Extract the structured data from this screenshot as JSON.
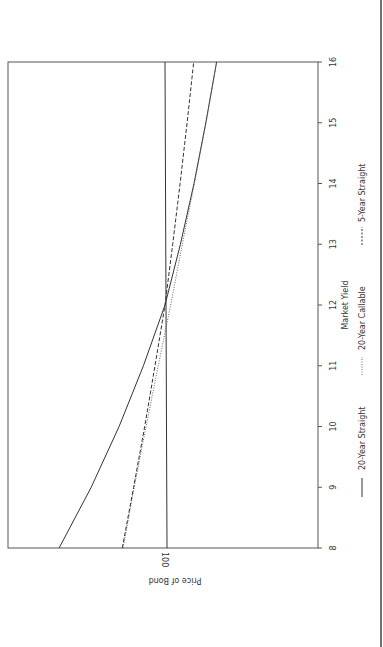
{
  "chart_data": {
    "type": "line",
    "orientation": "rotated 90 degrees clockwise (x-axis runs vertically on page)",
    "title": "",
    "xlabel": "Market Yield",
    "ylabel": "Price of Bond",
    "x_ticks": [
      "8",
      "9",
      "10",
      "11",
      "12",
      "13",
      "14",
      "15",
      "16"
    ],
    "y_ticks": [
      "100"
    ],
    "xlim": [
      8,
      16
    ],
    "reference_line": {
      "price": 100,
      "label": "100"
    },
    "x": [
      8,
      9,
      10,
      11,
      12,
      13,
      14,
      15,
      16
    ],
    "series": [
      {
        "name": "20-Year Straight",
        "style": "solid",
        "values": [
          139.6,
          127.6,
          117.2,
          108.1,
          100.0,
          92.9,
          86.6,
          81.1,
          76.1
        ]
      },
      {
        "name": "20-Year Callable",
        "style": "dotted",
        "values": [
          115.9,
          111.7,
          107.2,
          102.6,
          97.4,
          92.0,
          86.4,
          81.0,
          76.1
        ]
      },
      {
        "name": "5-Year Straight",
        "style": "dashed",
        "values": [
          116.2,
          111.9,
          107.7,
          103.8,
          100.0,
          96.4,
          92.9,
          89.6,
          86.5
        ]
      }
    ],
    "legend": [
      "20-Year Straight",
      "20-Year Callable",
      "5-Year Straight"
    ],
    "legend_position": "bottom",
    "grid": false
  },
  "labels": {
    "xlabel": "Market Yield",
    "ylabel": "Price of Bond",
    "ref_tick": "100",
    "ticks": [
      "8",
      "9",
      "10",
      "11",
      "12",
      "13",
      "14",
      "15",
      "16"
    ],
    "legend": [
      "20-Year Straight",
      "20-Year Callable",
      "5-Year Straight"
    ]
  }
}
